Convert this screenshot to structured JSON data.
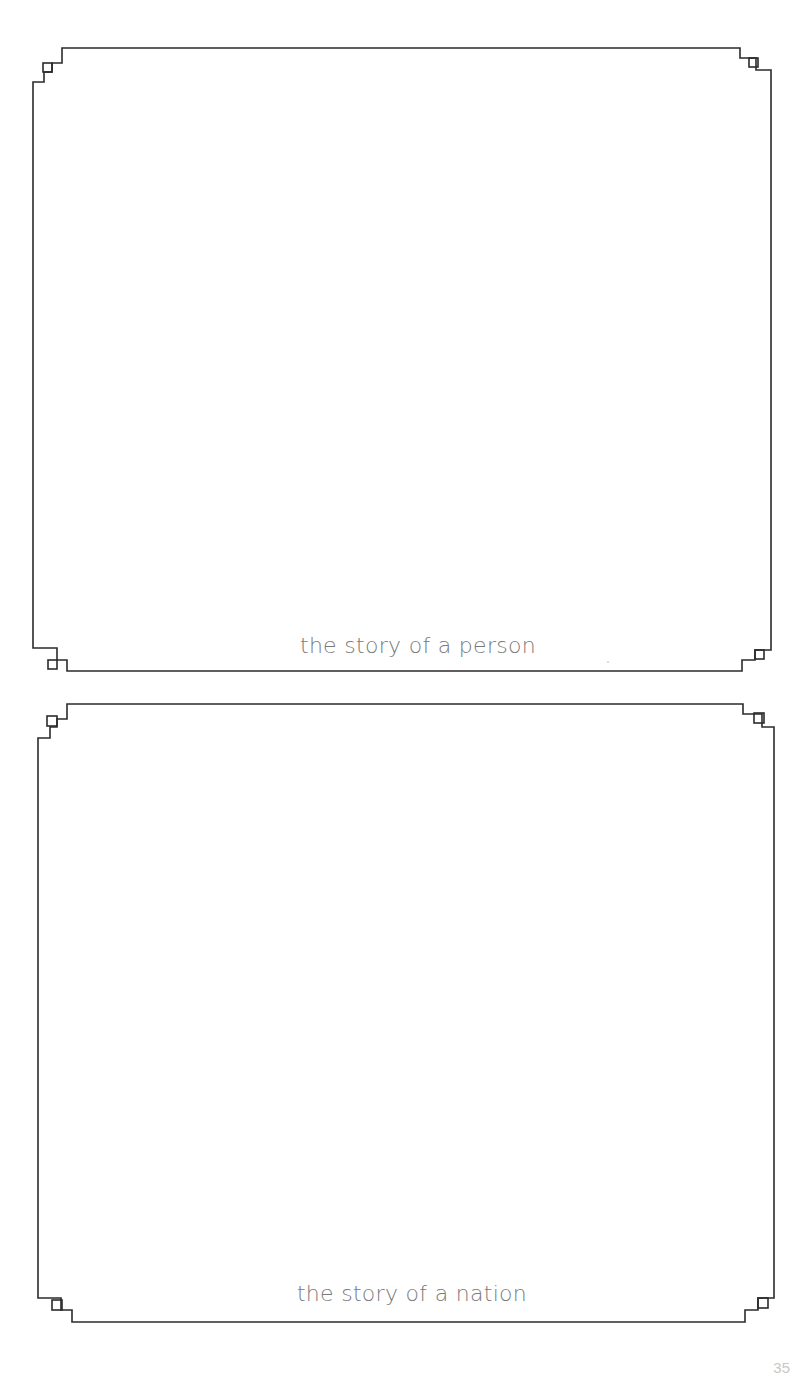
{
  "page": {
    "background": "#ffffff",
    "line_color": "#2b2b2b",
    "caption_color": "#7a7a7a"
  },
  "frames": [
    {
      "caption": "the story of a person",
      "content": ""
    },
    {
      "caption": "the story of a nation",
      "content": ""
    }
  ],
  "footer": {
    "page_number": "35"
  }
}
